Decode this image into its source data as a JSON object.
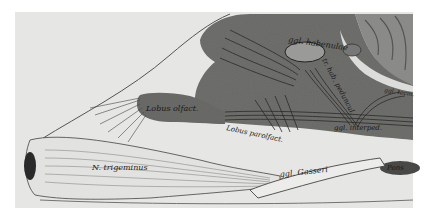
{
  "figure": {
    "type": "anatomical-illustration",
    "colors": {
      "background": "#e6e6e4",
      "brain_tissue": "#6e6e6c",
      "brain_dark": "#4a4a48",
      "cerebellum": "#8a8a88",
      "nerve_fibers": "#2a2a2a",
      "outline": "#333333"
    },
    "labels": {
      "ggl_habenulae": "ggl. habenulae",
      "tr_hab_peduncul": "tr. hab. peduncul.",
      "ggl_tecm": "ggl. tecm.",
      "lobus_olfact": "Lobus olfact.",
      "lobus_parolfact": "Lobus parolfact.",
      "ggl_interped": "ggl. interped.",
      "n_trigeminus": "N. trigeminus",
      "ggl_gasseri": "ggl. Gasseri",
      "pons": "Pons"
    }
  }
}
